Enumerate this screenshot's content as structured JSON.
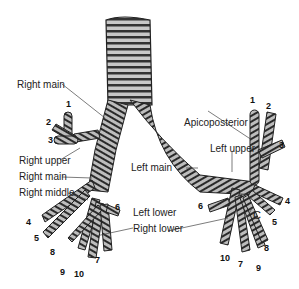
{
  "labels": {
    "right_main_top": "Right main",
    "right_upper": "Right upper",
    "right_main_lower": "Right main",
    "right_middle": "Right middle",
    "right_lower": "Right lower",
    "left_main": "Left main",
    "left_upper": "Left upper",
    "apicoposterior": "Apicoposterior",
    "left_lower": "Left lower",
    "c": "C"
  },
  "right_segments": [
    "1",
    "2",
    "3",
    "4",
    "5",
    "6",
    "7",
    "8",
    "9",
    "10"
  ],
  "left_segments": [
    "1",
    "2",
    "3",
    "4",
    "5",
    "6",
    "7",
    "8",
    "9",
    "10"
  ],
  "colors": {
    "ink": "#1a1a1a",
    "cartilage": "#9a9a9a",
    "background": "#ffffff"
  }
}
